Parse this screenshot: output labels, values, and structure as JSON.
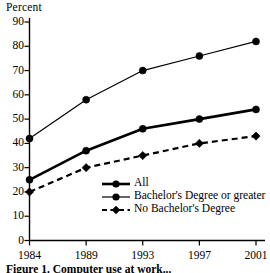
{
  "chart_data": {
    "type": "line",
    "title": "",
    "xlabel": "",
    "ylabel": "Percent",
    "categories": [
      "1984",
      "1989",
      "1993",
      "1997",
      "2001"
    ],
    "ylim": [
      0,
      90
    ],
    "ytick_labels": [
      "0",
      "10",
      "20",
      "30",
      "40",
      "50",
      "60",
      "70",
      "80",
      "90"
    ],
    "ytick_values": [
      0,
      10,
      20,
      30,
      40,
      50,
      60,
      70,
      80,
      90
    ],
    "grid": false,
    "legend_position": "inside-lower-right",
    "series": [
      {
        "name": "All",
        "style": "solid-thick",
        "marker": "circle",
        "color": "#000000",
        "values": [
          25,
          37,
          46,
          50,
          54
        ]
      },
      {
        "name": "Bachelor's Degree or greater",
        "style": "solid-thin",
        "marker": "circle",
        "color": "#000000",
        "values": [
          42,
          58,
          70,
          76,
          82
        ]
      },
      {
        "name": "No Bachelor's Degree",
        "style": "dashed",
        "marker": "diamond",
        "color": "#000000",
        "values": [
          20,
          30,
          35,
          40,
          43
        ]
      }
    ]
  },
  "figure": {
    "ylabel": "Percent",
    "caption": "Figure 1.  Computer use at work..."
  }
}
